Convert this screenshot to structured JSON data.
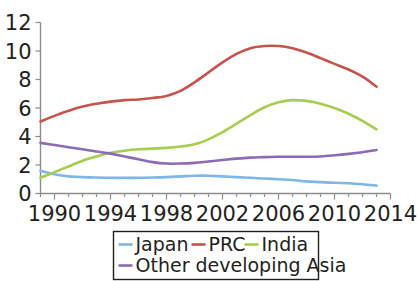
{
  "chart_data": {
    "type": "line",
    "title": "",
    "subtitle": "",
    "xlabel": "",
    "ylabel": "",
    "xlim": [
      1989,
      2014
    ],
    "ylim": [
      0,
      12
    ],
    "yticks": [
      0,
      2,
      4,
      6,
      8,
      10,
      12
    ],
    "ytick_labels": [
      "0",
      "2",
      "4",
      "6",
      "8",
      "10",
      "12"
    ],
    "xticks": [
      1990,
      1994,
      1998,
      2002,
      2006,
      2010,
      2014
    ],
    "xtick_labels": [
      "1990",
      "1994",
      "1998",
      "2002",
      "2006",
      "2010",
      "2014"
    ],
    "x_minor_tick_interval": 1,
    "grid": false,
    "legend_position": "bottom",
    "x": [
      1989,
      1990,
      1991,
      1992,
      1993,
      1994,
      1995,
      1996,
      1997,
      1998,
      1999,
      2000,
      2001,
      2002,
      2003,
      2004,
      2005,
      2006,
      2007,
      2008,
      2009,
      2010,
      2011,
      2012,
      2013
    ],
    "series": [
      {
        "name": "Japan",
        "color": "#7fb6e8",
        "values": [
          1.6,
          1.35,
          1.2,
          1.15,
          1.12,
          1.1,
          1.1,
          1.1,
          1.12,
          1.15,
          1.2,
          1.25,
          1.25,
          1.2,
          1.15,
          1.1,
          1.05,
          1.0,
          0.95,
          0.85,
          0.8,
          0.75,
          0.72,
          0.65,
          0.55
        ]
      },
      {
        "name": "PRC",
        "color": "#c5544a",
        "values": [
          5.05,
          5.45,
          5.8,
          6.1,
          6.3,
          6.45,
          6.55,
          6.6,
          6.7,
          6.85,
          7.2,
          7.8,
          8.5,
          9.2,
          9.8,
          10.2,
          10.35,
          10.35,
          10.2,
          9.9,
          9.5,
          9.1,
          8.7,
          8.2,
          7.5
        ]
      },
      {
        "name": "India",
        "color": "#a5ce4e",
        "values": [
          1.1,
          1.5,
          1.9,
          2.3,
          2.6,
          2.85,
          3.0,
          3.1,
          3.15,
          3.2,
          3.3,
          3.45,
          3.8,
          4.3,
          4.9,
          5.5,
          6.05,
          6.4,
          6.55,
          6.5,
          6.3,
          6.0,
          5.6,
          5.1,
          4.5
        ]
      },
      {
        "name": "Other developing Asia",
        "color": "#8b6bb5",
        "values": [
          3.55,
          3.4,
          3.25,
          3.1,
          2.95,
          2.8,
          2.6,
          2.4,
          2.2,
          2.1,
          2.1,
          2.15,
          2.25,
          2.35,
          2.45,
          2.52,
          2.55,
          2.58,
          2.58,
          2.58,
          2.6,
          2.68,
          2.78,
          2.9,
          3.05
        ]
      }
    ]
  },
  "legend": {
    "entries": [
      {
        "label": "Japan",
        "color": "#7fb6e8"
      },
      {
        "label": "PRC",
        "color": "#c5544a"
      },
      {
        "label": "India",
        "color": "#a5ce4e"
      },
      {
        "label": "Other developing Asia",
        "color": "#8b6bb5"
      }
    ]
  },
  "axes": {
    "y_label_0": "0",
    "y_label_2": "2",
    "y_label_4": "4",
    "y_label_6": "6",
    "y_label_8": "8",
    "y_label_10": "10",
    "y_label_12": "12",
    "x_label_1990": "1990",
    "x_label_1994": "1994",
    "x_label_1998": "1998",
    "x_label_2002": "2002",
    "x_label_2006": "2006",
    "x_label_2010": "2010",
    "x_label_2014": "2014"
  }
}
